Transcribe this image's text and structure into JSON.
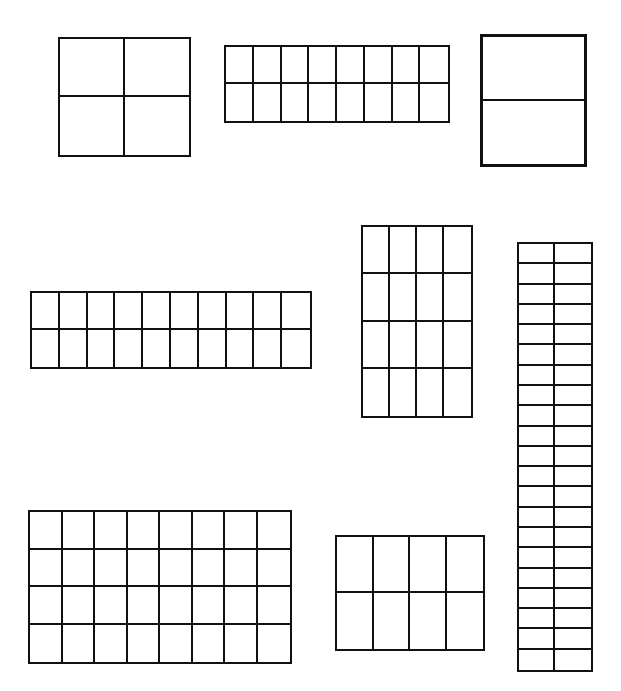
{
  "line_color": "#111111",
  "background": "#ffffff",
  "grids": [
    {
      "id": "grid-a",
      "label": "2 by 2 grid",
      "rows": 2,
      "cols": 2,
      "x": 58,
      "y": 37,
      "w": 133,
      "h": 120,
      "border": 2
    },
    {
      "id": "grid-b",
      "label": "2 by 8 grid",
      "rows": 2,
      "cols": 8,
      "x": 224,
      "y": 45,
      "w": 226,
      "h": 78,
      "border": 2
    },
    {
      "id": "grid-c",
      "label": "2 by 1 grid",
      "rows": 2,
      "cols": 1,
      "x": 480,
      "y": 34,
      "w": 107,
      "h": 133,
      "border": 3
    },
    {
      "id": "grid-d",
      "label": "2 by 10 grid",
      "rows": 2,
      "cols": 10,
      "x": 30,
      "y": 291,
      "w": 282,
      "h": 78,
      "border": 2
    },
    {
      "id": "grid-e",
      "label": "4 by 4 grid",
      "rows": 4,
      "cols": 4,
      "x": 361,
      "y": 225,
      "w": 112,
      "h": 193,
      "border": 2
    },
    {
      "id": "grid-f",
      "label": "21 by 2 grid",
      "rows": 21,
      "cols": 2,
      "x": 517,
      "y": 242,
      "w": 76,
      "h": 430,
      "border": 2
    },
    {
      "id": "grid-g",
      "label": "4 by 8 grid",
      "rows": 4,
      "cols": 8,
      "x": 28,
      "y": 510,
      "w": 264,
      "h": 154,
      "border": 2
    },
    {
      "id": "grid-h",
      "label": "2 by 4 grid",
      "rows": 2,
      "cols": 4,
      "x": 335,
      "y": 535,
      "w": 150,
      "h": 116,
      "border": 2
    }
  ]
}
